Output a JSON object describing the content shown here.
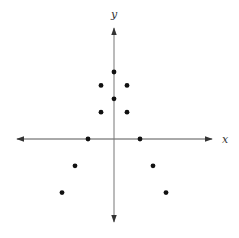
{
  "chart_data": {
    "type": "scatter",
    "title": "",
    "xlabel": "x",
    "ylabel": "y",
    "grid": false,
    "legend": null,
    "xlim": [
      -7.5,
      8
    ],
    "ylim": [
      -6.3,
      7.5
    ],
    "points": [
      {
        "x": 0,
        "y": 5
      },
      {
        "x": -1,
        "y": 4
      },
      {
        "x": 1,
        "y": 4
      },
      {
        "x": 0,
        "y": 3
      },
      {
        "x": -1,
        "y": 2
      },
      {
        "x": 1,
        "y": 2
      },
      {
        "x": -2,
        "y": 0
      },
      {
        "x": 2,
        "y": 0
      },
      {
        "x": -3,
        "y": -2
      },
      {
        "x": 3,
        "y": -2
      },
      {
        "x": -4,
        "y": -4
      },
      {
        "x": 4,
        "y": -4
      }
    ]
  },
  "colors": {
    "axis": "#555555",
    "point": "#111111",
    "background": "#ffffff"
  }
}
